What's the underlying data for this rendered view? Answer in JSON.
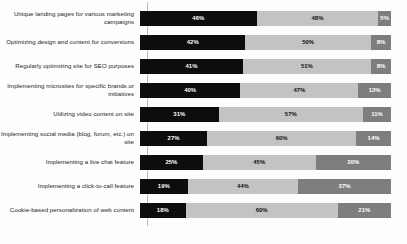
{
  "chart_data": {
    "type": "bar",
    "orientation": "horizontal",
    "stacked": true,
    "stack_mode": "percent",
    "title": "",
    "subtitle": "",
    "xlabel": "",
    "ylabel": "",
    "xlim": [
      0,
      100
    ],
    "grid": false,
    "legend": "none",
    "value_suffix": "%",
    "categories": [
      "Unique landing pages for various marketing campaigns",
      "Optimizing design and content for conversions",
      "Regularly optimizing site for SEO purposes",
      "Implementing microsites for specific brands or initiatives",
      "Utilizing video content on site",
      "Implementing social media (blog, forum, etc.) on site",
      "Implementing a live chat feature",
      "Implementing a click-to-call feature",
      "Cookie-based personalization of web content"
    ],
    "series": [
      {
        "name": "series-1",
        "color": "#0d0d0d",
        "values": [
          46,
          42,
          41,
          40,
          31,
          27,
          25,
          19,
          18
        ],
        "labels": [
          "46%",
          "42%",
          "41%",
          "40%",
          "31%",
          "27%",
          "25%",
          "19%",
          "18%"
        ]
      },
      {
        "name": "series-2",
        "color": "#c3c3c3",
        "values": [
          48,
          50,
          51,
          47,
          57,
          60,
          45,
          44,
          60
        ],
        "labels": [
          "48%",
          "50%",
          "51%",
          "47%",
          "57%",
          "60%",
          "45%",
          "44%",
          "60%"
        ]
      },
      {
        "name": "series-3",
        "color": "#7e7e7e",
        "values": [
          5,
          8,
          8,
          13,
          11,
          14,
          30,
          37,
          21
        ],
        "labels": [
          "5%",
          "8%",
          "8%",
          "13%",
          "11%",
          "14%",
          "30%",
          "37%",
          "21%"
        ]
      }
    ]
  },
  "colors": {
    "segment_1": "#0d0d0d",
    "segment_2": "#c3c3c3",
    "segment_3": "#7e7e7e",
    "background": "#fdfdfd",
    "axis_line": "#b9b9b9",
    "label_text": "#1c1c1c"
  }
}
